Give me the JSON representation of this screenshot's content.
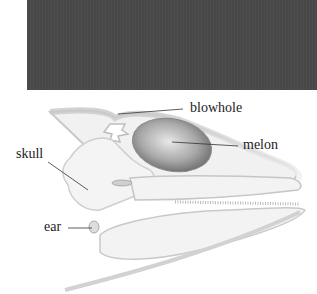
{
  "figure": {
    "photo_placeholder_color": "#4a4a4a",
    "labels": [
      {
        "id": "blowhole",
        "text": "blowhole"
      },
      {
        "id": "melon",
        "text": "melon"
      },
      {
        "id": "skull",
        "text": "skull"
      },
      {
        "id": "ear",
        "text": "ear"
      }
    ]
  }
}
